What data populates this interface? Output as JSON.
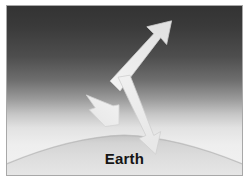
{
  "figure": {
    "domain_label": "atmosphere-radiation-diagram",
    "caption": "Earth",
    "background": {
      "space_color": "#353535",
      "upper_atmosphere_color": "#8f8f8f",
      "mid_atmosphere_color": "#dcdcdc",
      "haze_color": "#f2f2f2",
      "earth_surface_color": "#dedede",
      "earth_limb_shadow_color": "#bcbcbc",
      "frame_border_color": "#a8a8a8",
      "page_color": "#ffffff"
    },
    "arrows": [
      {
        "id": "outgoing-upward-arrow",
        "name": "outgoing-radiation-arrow",
        "direction": "up-right",
        "fill": "#e9e9e9",
        "edge": "#c9c9c9"
      },
      {
        "id": "scattered-upleft-arrow",
        "name": "scattered-radiation-arrow",
        "direction": "up-left",
        "fill": "#ececec",
        "edge": "#cfcfcf"
      },
      {
        "id": "incoming-downward-arrow",
        "name": "incoming-radiation-arrow",
        "direction": "down-right",
        "fill": "#ededed",
        "edge": "#cdcdcd"
      }
    ]
  }
}
